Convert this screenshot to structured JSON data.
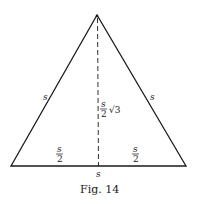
{
  "figure": {
    "caption": "Fig. 14",
    "shape": "equilateral-triangle",
    "labels": {
      "left_side": "s",
      "right_side": "s",
      "base": "s",
      "altitude_numerator": "s",
      "altitude_denominator": "2",
      "altitude_radical": "√3",
      "left_half_base_numerator": "s",
      "left_half_base_denominator": "2",
      "right_half_base_numerator": "s",
      "right_half_base_denominator": "2"
    },
    "colors": {
      "stroke": "#1a1a1a",
      "background": "#ffffff"
    }
  }
}
